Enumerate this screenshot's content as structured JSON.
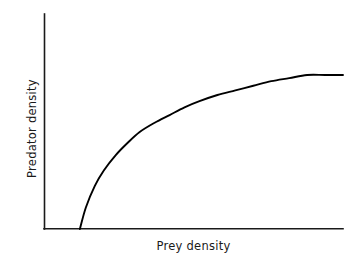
{
  "figure": {
    "background_color": "#ffffff",
    "line_color": "#000000",
    "axis_color": "#1a1a1a",
    "text_color": "#1a1a1a"
  },
  "chart_data": {
    "type": "line",
    "title": "",
    "subtitle": "",
    "xlabel": "Prey density",
    "ylabel": "Predator density",
    "grid": false,
    "legend": null,
    "legend_position": "none",
    "axis_ticks": false,
    "tick_labels": {
      "x": [],
      "y": []
    },
    "xlim": [
      0,
      1
    ],
    "ylim": [
      0,
      1
    ],
    "annotations": [],
    "series": [
      {
        "name": "predator response curve",
        "description": "Saturating curve: zero until a prey-density threshold, then rising steeply and levelling off at a plateau",
        "x": [
          0.12,
          0.14,
          0.17,
          0.2,
          0.24,
          0.28,
          0.32,
          0.37,
          0.42,
          0.47,
          0.52,
          0.58,
          0.64,
          0.7,
          0.76,
          0.82,
          0.88,
          0.94,
          1.0
        ],
        "y": [
          0.0,
          0.14,
          0.28,
          0.38,
          0.48,
          0.56,
          0.63,
          0.69,
          0.74,
          0.79,
          0.83,
          0.87,
          0.9,
          0.93,
          0.96,
          0.98,
          1.0,
          1.0,
          1.0
        ]
      }
    ]
  },
  "geometry": {
    "y_axis_x": 44,
    "y_axis_top": 14,
    "x_axis_y": 229,
    "x_axis_right": 343,
    "curve_start_x": 80,
    "plateau_y": 75
  }
}
